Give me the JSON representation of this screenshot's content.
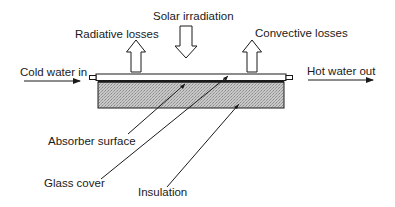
{
  "labels": {
    "solar_irradiation": "Solar irradiation",
    "radiative_losses": "Radiative losses",
    "convective_losses": "Convective losses",
    "cold_water_in": "Cold water in",
    "hot_water_out": "Hot water out",
    "absorber_surface": "Absorber surface",
    "glass_cover": "Glass cover",
    "insulation": "Insulation"
  },
  "colors": {
    "line": "#1a1a1a",
    "insulation_fill": "#bdbdbd",
    "background": "#ffffff"
  }
}
